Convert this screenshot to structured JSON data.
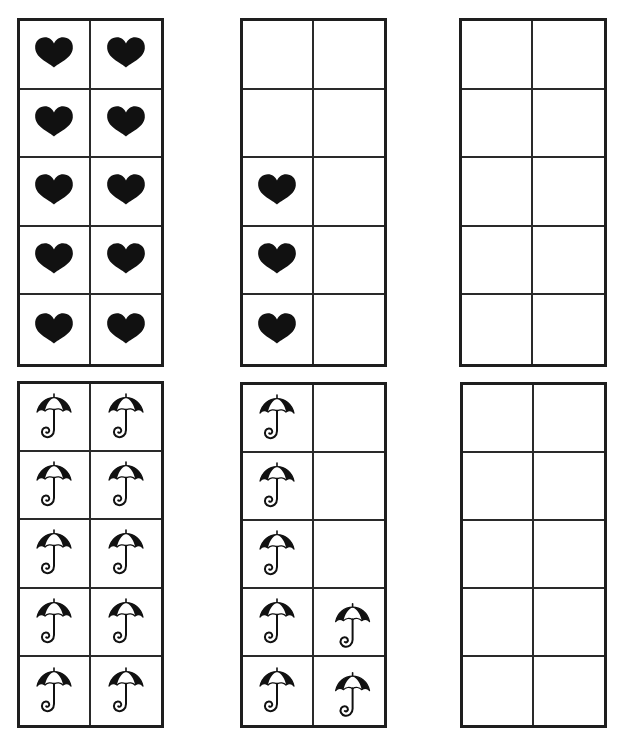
{
  "worksheet": {
    "title": "Ten-frame counting",
    "border_color": "#1e1e1e",
    "line_color": "#2a2a2a",
    "icon_color": "#111111",
    "frames": [
      {
        "id": "hearts-full",
        "icon": "heart-icon",
        "rect": [
          17,
          18,
          147,
          349
        ],
        "filled": [
          [
            true,
            true
          ],
          [
            true,
            true
          ],
          [
            true,
            true
          ],
          [
            true,
            true
          ],
          [
            true,
            true
          ]
        ],
        "count": 10
      },
      {
        "id": "hearts-partial",
        "icon": "heart-icon",
        "rect": [
          240,
          18,
          147,
          349
        ],
        "filled": [
          [
            false,
            false
          ],
          [
            false,
            false
          ],
          [
            true,
            false
          ],
          [
            true,
            false
          ],
          [
            true,
            false
          ]
        ],
        "count": 3
      },
      {
        "id": "hearts-empty",
        "icon": "heart-icon",
        "rect": [
          459,
          18,
          148,
          349
        ],
        "filled": [
          [
            false,
            false
          ],
          [
            false,
            false
          ],
          [
            false,
            false
          ],
          [
            false,
            false
          ],
          [
            false,
            false
          ]
        ],
        "count": 0
      },
      {
        "id": "umbrellas-full",
        "icon": "umbrella-icon",
        "rect": [
          17,
          381,
          147,
          347
        ],
        "filled": [
          [
            true,
            true
          ],
          [
            true,
            true
          ],
          [
            true,
            true
          ],
          [
            true,
            true
          ],
          [
            true,
            true
          ]
        ],
        "count": 10
      },
      {
        "id": "umbrellas-partial",
        "icon": "umbrella-icon",
        "rect": [
          240,
          382,
          147,
          346
        ],
        "filled": [
          [
            true,
            false
          ],
          [
            true,
            false
          ],
          [
            true,
            false
          ],
          [
            true,
            true
          ],
          [
            true,
            true
          ]
        ],
        "count": 7
      },
      {
        "id": "umbrellas-empty",
        "icon": "umbrella-icon",
        "rect": [
          460,
          382,
          147,
          346
        ],
        "filled": [
          [
            false,
            false
          ],
          [
            false,
            false
          ],
          [
            false,
            false
          ],
          [
            false,
            false
          ],
          [
            false,
            false
          ]
        ],
        "count": 0
      }
    ]
  }
}
